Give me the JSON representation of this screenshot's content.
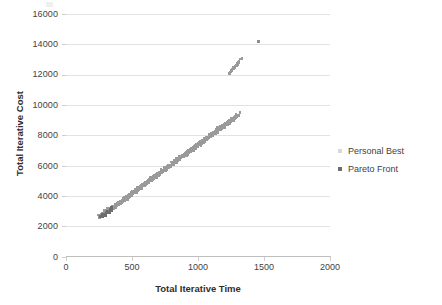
{
  "chart_data": {
    "type": "scatter",
    "title": "",
    "xlabel": "Total Iterative Time",
    "ylabel": "Total Iterative Cost",
    "xlim": [
      0,
      2000
    ],
    "ylim": [
      0,
      16000
    ],
    "xticks": [
      0,
      500,
      1000,
      1500,
      2000
    ],
    "yticks": [
      0,
      2000,
      4000,
      6000,
      8000,
      10000,
      12000,
      14000,
      16000
    ],
    "grid": "horizontal",
    "legend_position": "right",
    "series": [
      {
        "name": "Personal Best",
        "marker": "square",
        "color": "#9a9a9a",
        "description": "Dense linear cloud of points rising from about (250, 2900) to (1300, 13000), widening in the middle, plus one isolated outlier at (1450, 14300).",
        "points": [
          [
            258,
            2880
          ],
          [
            266,
            2830
          ],
          [
            272,
            2960
          ],
          [
            279,
            2900
          ],
          [
            286,
            3010
          ],
          [
            292,
            2950
          ],
          [
            299,
            3080
          ],
          [
            305,
            3020
          ],
          [
            312,
            3150
          ],
          [
            318,
            3100
          ],
          [
            325,
            3230
          ],
          [
            331,
            3180
          ],
          [
            338,
            3310
          ],
          [
            344,
            3260
          ],
          [
            351,
            3400
          ],
          [
            357,
            3350
          ],
          [
            364,
            3480
          ],
          [
            370,
            3430
          ],
          [
            377,
            3560
          ],
          [
            383,
            3510
          ],
          [
            390,
            3640
          ],
          [
            396,
            3590
          ],
          [
            403,
            3720
          ],
          [
            409,
            3670
          ],
          [
            416,
            3800
          ],
          [
            422,
            3760
          ],
          [
            429,
            3890
          ],
          [
            435,
            3840
          ],
          [
            442,
            3970
          ],
          [
            448,
            3920
          ],
          [
            455,
            4050
          ],
          [
            461,
            4010
          ],
          [
            468,
            4140
          ],
          [
            474,
            4090
          ],
          [
            481,
            4220
          ],
          [
            487,
            4170
          ],
          [
            494,
            4300
          ],
          [
            500,
            4260
          ],
          [
            507,
            4390
          ],
          [
            513,
            4340
          ],
          [
            520,
            4470
          ],
          [
            526,
            4420
          ],
          [
            533,
            4550
          ],
          [
            539,
            4510
          ],
          [
            546,
            4640
          ],
          [
            552,
            4590
          ],
          [
            559,
            4720
          ],
          [
            565,
            4670
          ],
          [
            572,
            4800
          ],
          [
            578,
            4760
          ],
          [
            585,
            4890
          ],
          [
            591,
            4840
          ],
          [
            598,
            4970
          ],
          [
            604,
            4920
          ],
          [
            611,
            5050
          ],
          [
            617,
            5010
          ],
          [
            624,
            5140
          ],
          [
            630,
            5090
          ],
          [
            637,
            5220
          ],
          [
            643,
            5170
          ],
          [
            650,
            5300
          ],
          [
            656,
            5260
          ],
          [
            663,
            5390
          ],
          [
            669,
            5340
          ],
          [
            676,
            5470
          ],
          [
            682,
            5420
          ],
          [
            689,
            5550
          ],
          [
            695,
            5510
          ],
          [
            702,
            5640
          ],
          [
            708,
            5590
          ],
          [
            715,
            5720
          ],
          [
            721,
            5670
          ],
          [
            728,
            5800
          ],
          [
            734,
            5760
          ],
          [
            741,
            5890
          ],
          [
            747,
            5840
          ],
          [
            754,
            5970
          ],
          [
            760,
            5920
          ],
          [
            767,
            6050
          ],
          [
            773,
            6010
          ],
          [
            780,
            6140
          ],
          [
            786,
            6090
          ],
          [
            793,
            6220
          ],
          [
            799,
            6170
          ],
          [
            806,
            6300
          ],
          [
            812,
            6260
          ],
          [
            819,
            6390
          ],
          [
            825,
            6340
          ],
          [
            832,
            6470
          ],
          [
            838,
            6420
          ],
          [
            845,
            6550
          ],
          [
            851,
            6510
          ],
          [
            858,
            6640
          ],
          [
            864,
            6590
          ],
          [
            871,
            6720
          ],
          [
            877,
            6670
          ],
          [
            884,
            6800
          ],
          [
            890,
            6760
          ],
          [
            897,
            6890
          ],
          [
            903,
            6840
          ],
          [
            910,
            6970
          ],
          [
            916,
            6920
          ],
          [
            923,
            7050
          ],
          [
            929,
            7010
          ],
          [
            936,
            7140
          ],
          [
            942,
            7090
          ],
          [
            949,
            7220
          ],
          [
            955,
            7170
          ],
          [
            962,
            7300
          ],
          [
            968,
            7260
          ],
          [
            975,
            7390
          ],
          [
            981,
            7340
          ],
          [
            988,
            7470
          ],
          [
            994,
            7420
          ],
          [
            1001,
            7550
          ],
          [
            1007,
            7510
          ],
          [
            1014,
            7640
          ],
          [
            1020,
            7590
          ],
          [
            1027,
            7720
          ],
          [
            1033,
            7670
          ],
          [
            1040,
            7800
          ],
          [
            1046,
            7760
          ],
          [
            1053,
            7890
          ],
          [
            1059,
            7840
          ],
          [
            1066,
            7970
          ],
          [
            1072,
            7920
          ],
          [
            1079,
            8050
          ],
          [
            1085,
            8010
          ],
          [
            1092,
            8140
          ],
          [
            1098,
            8090
          ],
          [
            1105,
            8220
          ],
          [
            1111,
            8170
          ],
          [
            1118,
            8300
          ],
          [
            1124,
            8260
          ],
          [
            1131,
            8390
          ],
          [
            1137,
            8340
          ],
          [
            1144,
            8470
          ],
          [
            1150,
            8420
          ],
          [
            1157,
            8550
          ],
          [
            1163,
            8510
          ],
          [
            1170,
            8640
          ],
          [
            1176,
            8590
          ],
          [
            1183,
            8720
          ],
          [
            1189,
            8670
          ],
          [
            1196,
            8800
          ],
          [
            1202,
            8760
          ],
          [
            1209,
            8890
          ],
          [
            1215,
            8840
          ],
          [
            1222,
            8970
          ],
          [
            1228,
            8920
          ],
          [
            1235,
            9050
          ],
          [
            1241,
            9010
          ],
          [
            1248,
            9140
          ],
          [
            1254,
            9090
          ],
          [
            1261,
            9220
          ],
          [
            1267,
            9170
          ],
          [
            1274,
            9300
          ],
          [
            1280,
            9260
          ],
          [
            1287,
            9390
          ],
          [
            1293,
            9340
          ],
          [
            1300,
            12950
          ],
          [
            1290,
            12800
          ],
          [
            1275,
            12620
          ],
          [
            1262,
            12500
          ],
          [
            1248,
            12340
          ],
          [
            1235,
            12200
          ]
        ],
        "outliers": [
          [
            1450,
            14300
          ]
        ]
      },
      {
        "name": "Pareto Front",
        "marker": "square",
        "color": "#6e6e6e",
        "description": "Small cluster of darker points near the lower-left start of the band, around x 250-340, y 2800-3400.",
        "points": [
          [
            252,
            2800
          ],
          [
            262,
            2870
          ],
          [
            268,
            2790
          ],
          [
            278,
            2930
          ],
          [
            288,
            2860
          ],
          [
            296,
            3010
          ],
          [
            306,
            3120
          ],
          [
            316,
            3060
          ],
          [
            322,
            3240
          ],
          [
            330,
            3180
          ],
          [
            336,
            3330
          ]
        ]
      }
    ]
  },
  "axes": {
    "x": {
      "title": "Total Iterative Time",
      "ticks": [
        "0",
        "500",
        "1000",
        "1500",
        "2000"
      ]
    },
    "y": {
      "title": "Total Iterative Cost",
      "ticks": [
        "16000",
        "14000",
        "12000",
        "10000",
        "8000",
        "6000",
        "4000",
        "2000",
        "0"
      ]
    }
  },
  "legend": {
    "items": [
      {
        "label": "Personal Best",
        "color": "#d8d8d8",
        "marker": "square"
      },
      {
        "label": "Pareto Front",
        "color": "#6e6e6e",
        "marker": "square"
      }
    ]
  },
  "style": {
    "background": "#ffffff",
    "gridline_color": "#e2e2e2",
    "axis_color": "#bfbfbf",
    "text_color": "#3f3f3f"
  }
}
